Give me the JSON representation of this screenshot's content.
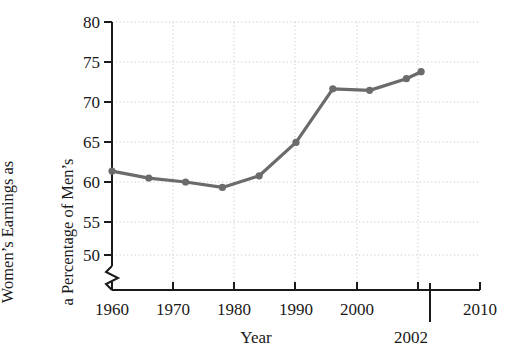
{
  "chart_data": {
    "type": "line",
    "title": "",
    "xlabel": "Year",
    "ylabel_line1": "Women’s Earnings as",
    "ylabel_line2": "a Percentage of Men’s",
    "x": [
      1960,
      1965,
      1970,
      1975,
      1980,
      1985,
      1990,
      1995,
      2000,
      2002
    ],
    "values": [
      60.8,
      59.9,
      59.4,
      58.7,
      60.2,
      64.5,
      71.4,
      71.2,
      72.7,
      73.6
    ],
    "xlim": [
      1960,
      2010
    ],
    "ylim": [
      48.5,
      80
    ],
    "xticks": [
      1960,
      1970,
      1980,
      1990,
      2000,
      2010
    ],
    "xtick_labels": [
      "1960",
      "1970",
      "1980",
      "1990",
      "2000",
      "2010"
    ],
    "yticks": [
      50,
      55,
      60,
      65,
      70,
      75,
      80
    ],
    "ytick_labels": [
      "50",
      "55",
      "60",
      "65",
      "70",
      "75",
      "80"
    ],
    "grid": true,
    "grid_style": "dotted",
    "legend": "none",
    "y_axis_break": true,
    "annotations": [
      {
        "label": "2002",
        "x": 2002,
        "type": "vertical-marker"
      }
    ],
    "series_color": "#6b6b6b",
    "axis_color": "#1a1a1a",
    "grid_color": "#c9c9c9",
    "marker": "circle"
  },
  "axis": {
    "y_break_symbol": "axis-break-zigzag"
  }
}
